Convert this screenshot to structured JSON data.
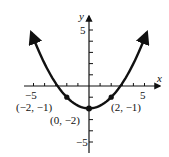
{
  "chart_data": {
    "type": "line",
    "title": "",
    "function": "y = (1/4)x^2 - 2",
    "xlabel": "x",
    "ylabel": "y",
    "xlim": [
      -5.5,
      6
    ],
    "ylim": [
      -6,
      6
    ],
    "x_ticks": [
      -5,
      -4,
      -3,
      -2,
      -1,
      1,
      2,
      3,
      4,
      5
    ],
    "y_ticks": [
      -5,
      -4,
      -3,
      -2,
      -1,
      1,
      2,
      3,
      4,
      5
    ],
    "x_tick_labels": {
      "-5": "−5",
      "5": "5"
    },
    "y_tick_labels": {
      "5": "5",
      "-5": "−5"
    },
    "points": [
      {
        "x": -2,
        "y": -1,
        "label": "(−2, −1)"
      },
      {
        "x": 0,
        "y": -2,
        "label": "(0, −2)"
      },
      {
        "x": 2,
        "y": -1,
        "label": "(2, −1)"
      }
    ],
    "curve_color": "#111111",
    "grid": false,
    "arrows_on_ends": true
  },
  "labels": {
    "x_axis": "x",
    "y_axis": "y",
    "x_min": "−5",
    "x_max": "5",
    "y_max": "5",
    "y_min": "−5",
    "pt_left": "(−2, −1)",
    "pt_vertex": "(0, −2)",
    "pt_right": "(2, −1)"
  }
}
